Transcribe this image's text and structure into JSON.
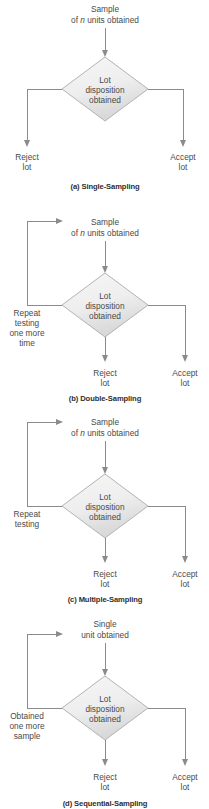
{
  "figure": {
    "line_color": "#8b8b8b",
    "text_color": "#4a4a4a",
    "diamond_fill_light": "#f2f2f2",
    "diamond_fill_dark": "#d9d9d9",
    "diamond_stroke": "#b3b3b3",
    "background": "#ffffff"
  },
  "common": {
    "decision_line1": "Lot",
    "decision_line2": "disposition",
    "decision_line3": "obtained",
    "reject_line1": "Reject",
    "reject_line2": "lot",
    "accept_line1": "Accept",
    "accept_line2": "lot"
  },
  "panels": [
    {
      "id": "single-sampling",
      "caption": "(a) Single-Sampling",
      "source_line1": "Sample",
      "source_line2_pre": "of ",
      "source_line2_italic": "n",
      "source_line2_post": " units obtained",
      "feedback": null
    },
    {
      "id": "double-sampling",
      "caption": "(b) Double-Sampling",
      "source_line1": "Sample",
      "source_line2_pre": "of ",
      "source_line2_italic": "n",
      "source_line2_post": " units obtained",
      "feedback": [
        "Repeat",
        "testing",
        "one more",
        "time"
      ]
    },
    {
      "id": "multiple-sampling",
      "caption": "(c) Multiple-Sampling",
      "source_line1": "Sample",
      "source_line2_pre": "of ",
      "source_line2_italic": "n",
      "source_line2_post": " units obtained",
      "feedback": [
        "Repeat",
        "testing"
      ]
    },
    {
      "id": "sequential-sampling",
      "caption": "(d) Sequential-Sampling",
      "source_line1": "Single",
      "source_line2_pre": "",
      "source_line2_italic": "",
      "source_line2_post": "unit obtained",
      "feedback": [
        "Obtained",
        "one more",
        "sample"
      ]
    }
  ]
}
